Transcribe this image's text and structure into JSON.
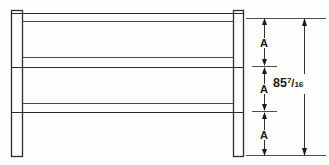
{
  "drawing": {
    "title": "Railing elevation with equal-spaced rails",
    "background_color": "#fdfdfb",
    "line_color": "#2b2b2b",
    "dimension_color": "#1a1a1a",
    "posts": [
      {
        "name": "left-post",
        "x": 11,
        "y": 10,
        "width": 12,
        "height": 147
      },
      {
        "name": "right-post",
        "x": 233,
        "y": 10,
        "width": 11,
        "height": 147
      }
    ],
    "rails": [
      {
        "name": "top-rail",
        "y": 13,
        "height": 9
      },
      {
        "name": "middle-rail",
        "y": 57,
        "height": 11
      },
      {
        "name": "bottom-rail",
        "y": 103,
        "height": 10
      }
    ],
    "dimensions": {
      "segments": [
        {
          "label": "A",
          "from_y": 18,
          "to_y": 63
        },
        {
          "label": "A",
          "from_y": 69,
          "to_y": 108
        },
        {
          "label": "A",
          "from_y": 114,
          "to_y": 155
        }
      ],
      "overall": {
        "whole": "85",
        "numerator": "7",
        "slash": "/",
        "denominator": "16",
        "from_y": 18,
        "to_y": 155
      }
    },
    "extension_lines": [
      {
        "name": "top-extension-line",
        "y": 18,
        "x1": 246,
        "x2": 326
      },
      {
        "name": "upper-tick-extension-line",
        "y": 66,
        "x1": 252,
        "x2": 276
      },
      {
        "name": "lower-tick-extension-line",
        "y": 111,
        "x1": 252,
        "x2": 276
      },
      {
        "name": "bottom-extension-line",
        "y": 155,
        "x1": 246,
        "x2": 326
      }
    ]
  }
}
